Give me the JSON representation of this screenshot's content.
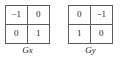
{
  "figure": {
    "background_color": "#ffffff",
    "border_color": "#5b5b5b",
    "text_color": "#1a1a1a"
  },
  "kernels": [
    {
      "label": "Gx",
      "rows": [
        [
          "−1",
          "0"
        ],
        [
          "0",
          "1"
        ]
      ]
    },
    {
      "label": "Gy",
      "rows": [
        [
          "0",
          "−1"
        ],
        [
          "1",
          "0"
        ]
      ]
    }
  ],
  "chart_data": {
    "type": "table",
    "title": "",
    "matrices": [
      {
        "name": "Gx",
        "shape": [
          2,
          2
        ],
        "values": [
          [
            -1,
            0
          ],
          [
            0,
            1
          ]
        ]
      },
      {
        "name": "Gy",
        "shape": [
          2,
          2
        ],
        "values": [
          [
            0,
            -1
          ],
          [
            1,
            0
          ]
        ]
      }
    ]
  }
}
